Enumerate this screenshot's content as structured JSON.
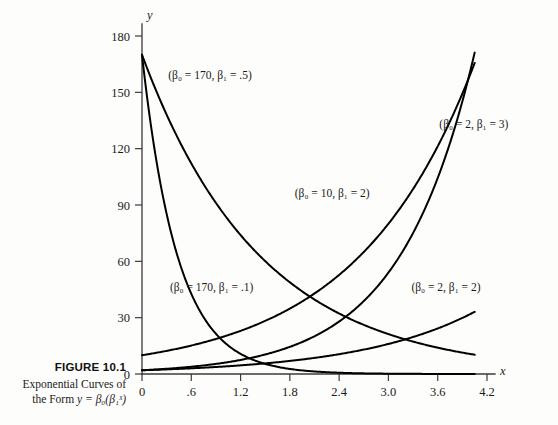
{
  "caption": {
    "title": "FIGURE 10.1",
    "line1": "Exponential Curves of",
    "line2_prefix": "the Form ",
    "line2_math": "y = β₀(β₁ˣ)"
  },
  "chart_data": {
    "type": "line",
    "title": "",
    "subtitle": "",
    "xlabel": "x",
    "ylabel": "y",
    "xlim": [
      0,
      4.2
    ],
    "ylim": [
      0,
      180
    ],
    "grid": false,
    "legend_position": "inline-annotations",
    "xticks": [
      "0",
      ".6",
      "1.2",
      "1.8",
      "2.4",
      "3.0",
      "3.6",
      "4.2"
    ],
    "xtick_values": [
      0,
      0.6,
      1.2,
      1.8,
      2.4,
      3.0,
      3.6,
      4.2
    ],
    "yticks": [
      "0",
      "30",
      "60",
      "90",
      "120",
      "150",
      "180"
    ],
    "ytick_values": [
      0,
      30,
      60,
      90,
      120,
      150,
      180
    ],
    "formula": "y = b0 * (b1 ^ x)",
    "x_domain_start": 0,
    "x_domain_end": 4.05,
    "series": [
      {
        "name": "(β₀ = 170, β₁ = .5)",
        "b0": 170,
        "b1": 0.5,
        "label": "(β₀ = 170, β₁ = .5)",
        "label_x": 0.32,
        "label_y": 157,
        "label_anchor": "start"
      },
      {
        "name": "(β₀ = 170, β₁ = .1)",
        "b0": 170,
        "b1": 0.1,
        "label": "(β₀ = 170, β₁ = .1)",
        "label_x": 0.34,
        "label_y": 44,
        "label_anchor": "start"
      },
      {
        "name": "(β₀ = 10, β₁ = 2)",
        "b0": 10,
        "b1": 2,
        "label": "(β₀ = 10, β₁ = 2)",
        "label_x": 1.86,
        "label_y": 94,
        "label_anchor": "start"
      },
      {
        "name": "(β₀ = 2, β₁ = 3)",
        "b0": 2,
        "b1": 3,
        "label": "(β₀ = 2, β₁ = 3)",
        "label_x": 3.62,
        "label_y": 131,
        "label_anchor": "start"
      },
      {
        "name": "(β₀ = 2, β₁ = 2)",
        "b0": 2,
        "b1": 2,
        "label": "(β₀ = 2, β₁ = 2)",
        "label_x": 3.28,
        "label_y": 44,
        "label_anchor": "start"
      }
    ]
  }
}
